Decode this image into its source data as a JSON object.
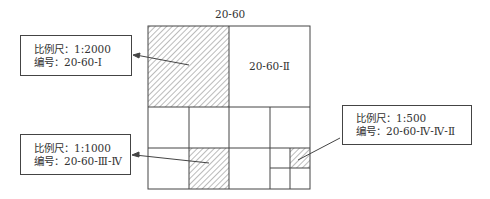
{
  "diagram": {
    "title": "20-60",
    "quadrant_label": "20-60-Ⅱ",
    "callouts": [
      {
        "id": "1-2000",
        "scale_label": "比例尺：1:2000",
        "code_label": "编号：20-60-Ⅰ"
      },
      {
        "id": "1-1000",
        "scale_label": "比例尺：1:1000",
        "code_label": "编号：20-60-Ⅲ-Ⅳ"
      },
      {
        "id": "1-500",
        "scale_label": "比例尺：1:500",
        "code_label": "编号：20-60-Ⅳ-Ⅳ-Ⅱ"
      }
    ],
    "colors": {
      "line": "#444444",
      "hatch": "#555555",
      "background": "#ffffff"
    }
  }
}
